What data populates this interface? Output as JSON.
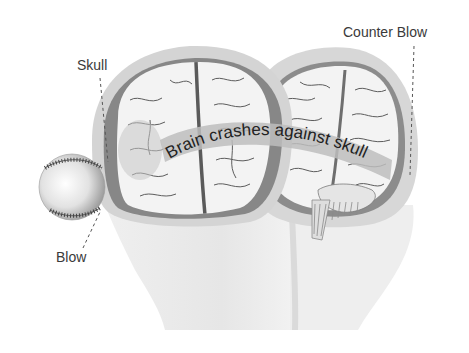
{
  "figure": {
    "labels": {
      "skull": "Skull",
      "counter_blow": "Counter Blow",
      "blow": "Blow",
      "banner": "Brain crashes against skull"
    },
    "objects": [
      "baseball",
      "head-left",
      "head-right",
      "brain-left",
      "brain-right",
      "skull-bone",
      "cerebellum",
      "brainstem"
    ],
    "colors": {
      "background": "#ffffff",
      "text": "#3a3a3a",
      "skull": "#d4d4d4",
      "skull_inner": "#8a8a8a",
      "brain": "#f2f2f2",
      "brain_lines": "#555555",
      "face": "#ececec",
      "banner": "#bdbdbd"
    }
  }
}
